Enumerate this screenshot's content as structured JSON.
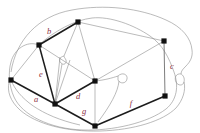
{
  "figure": {
    "kind": "planar-graph-drawing",
    "background_color": "#ffffff",
    "vertex_color": "#111111",
    "thick_edge_color": "#1c1c1c",
    "thin_edge_color": "#8d8d8d",
    "label_color": "#8c2f3f",
    "width": 200,
    "height": 133
  },
  "vertices": [
    {
      "id": "v_top",
      "name": "vertex-top",
      "x": 78,
      "y": 22
    },
    {
      "id": "v_upleft",
      "name": "vertex-upper-left",
      "x": 39,
      "y": 45
    },
    {
      "id": "v_left",
      "name": "vertex-left",
      "x": 11,
      "y": 80
    },
    {
      "id": "v_lowleft",
      "name": "vertex-lower-left",
      "x": 55,
      "y": 104
    },
    {
      "id": "v_center",
      "name": "vertex-center",
      "x": 95,
      "y": 81
    },
    {
      "id": "v_bottom",
      "name": "vertex-bottom",
      "x": 95,
      "y": 126
    },
    {
      "id": "v_upright",
      "name": "vertex-upper-right",
      "x": 164,
      "y": 41
    },
    {
      "id": "v_lowright",
      "name": "vertex-lower-right",
      "x": 165,
      "y": 96
    }
  ],
  "labels": [
    {
      "id": "b",
      "text": "b",
      "name": "edge-label-b",
      "x": 49,
      "y": 32
    },
    {
      "id": "e",
      "text": "e",
      "name": "edge-label-e",
      "x": 41,
      "y": 75
    },
    {
      "id": "a",
      "text": "a",
      "name": "edge-label-a",
      "x": 36,
      "y": 100
    },
    {
      "id": "d",
      "text": "d",
      "name": "edge-label-d",
      "x": 78,
      "y": 97
    },
    {
      "id": "g",
      "text": "g",
      "name": "edge-label-g",
      "x": 84,
      "y": 112
    },
    {
      "id": "f",
      "text": "f",
      "name": "edge-label-f",
      "x": 131,
      "y": 104
    },
    {
      "id": "c",
      "text": "c",
      "name": "edge-label-c",
      "x": 172,
      "y": 67
    }
  ],
  "edges": [
    {
      "id": "e_b",
      "name": "edge-b-thick",
      "weight": "thick"
    },
    {
      "id": "e_e",
      "name": "edge-e-thick",
      "weight": "thick"
    },
    {
      "id": "e_a",
      "name": "edge-a-thick",
      "weight": "thick"
    },
    {
      "id": "e_d",
      "name": "edge-d-thick",
      "weight": "thick"
    },
    {
      "id": "e_g",
      "name": "edge-g-thick",
      "weight": "thick"
    },
    {
      "id": "e_f",
      "name": "edge-f-thick",
      "weight": "thick"
    },
    {
      "id": "e_c",
      "name": "edge-c-mid",
      "weight": "mid"
    },
    {
      "id": "o1",
      "name": "edge-outer-boundary",
      "weight": "thin"
    },
    {
      "id": "o2",
      "name": "edge-outer-arc-top",
      "weight": "thin"
    },
    {
      "id": "o3",
      "name": "edge-outer-arc-right",
      "weight": "thin"
    },
    {
      "id": "o4",
      "name": "edge-outer-arc-bottom",
      "weight": "thin"
    },
    {
      "id": "i1",
      "name": "edge-top-to-center",
      "weight": "thin"
    },
    {
      "id": "i2",
      "name": "edge-top-to-upright",
      "weight": "thin"
    },
    {
      "id": "i3",
      "name": "edge-center-to-upright",
      "weight": "thin"
    },
    {
      "id": "i4",
      "name": "edge-upleft-to-center",
      "weight": "thin"
    },
    {
      "id": "i5",
      "name": "edge-left-to-upleft",
      "weight": "thin"
    },
    {
      "id": "i6",
      "name": "edge-top-to-lowleft",
      "weight": "thin"
    },
    {
      "id": "i7",
      "name": "edge-center-to-bottom",
      "weight": "thin"
    },
    {
      "id": "i8",
      "name": "edge-bridge-middle",
      "weight": "thin"
    },
    {
      "id": "i9",
      "name": "edge-bridge-right",
      "weight": "thin"
    },
    {
      "id": "i10",
      "name": "edge-upright-to-lowright",
      "weight": "mid"
    }
  ]
}
